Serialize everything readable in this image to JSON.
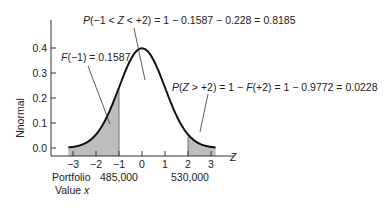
{
  "chart_data": {
    "type": "area",
    "title": "",
    "xlabel": "Z",
    "ylabel": "Nnormal",
    "x_ticks": [
      -3,
      -2,
      -1,
      0,
      1,
      2,
      3
    ],
    "x_tick_labels": [
      "−3",
      "−2",
      "−1",
      "0",
      "1",
      "2",
      "3"
    ],
    "y_ticks": [
      0.0,
      0.1,
      0.2,
      0.3,
      0.4
    ],
    "y_tick_labels": [
      "0.0",
      "0.1",
      "0.2",
      "0.3",
      "0.4"
    ],
    "xlim": [
      -3.3,
      3.3
    ],
    "ylim": [
      0,
      0.45
    ],
    "series": [
      {
        "name": "Standard normal density",
        "x": [
          -3,
          -2.5,
          -2,
          -1.5,
          -1,
          -0.5,
          0,
          0.5,
          1,
          1.5,
          2,
          2.5,
          3
        ],
        "values": [
          0.0044,
          0.0175,
          0.054,
          0.1295,
          0.242,
          0.3521,
          0.3989,
          0.3521,
          0.242,
          0.1295,
          0.054,
          0.0175,
          0.0044
        ]
      }
    ],
    "shaded_regions": [
      {
        "from": "-inf",
        "to": -1,
        "label": "F(−1) = 0.1587"
      },
      {
        "from": 2,
        "to": "+inf",
        "label": "P(Z > +2) = 1 − F(+2) = 1 − 0.9772 = 0.0228"
      }
    ],
    "annotations": [
      "P(−1 < Z < +2) = 1 − 0.1587 − 0.228 = 0.8185",
      "F(−1) = 0.1587",
      "P(Z > +2) = 1 − F(+2) = 1 − 0.9772 = 0.0228"
    ],
    "secondary_axis": {
      "label": "Portfolio Value x",
      "ticks": [
        {
          "z": -1,
          "label": "485,000"
        },
        {
          "z": 2,
          "label": "530,000"
        }
      ]
    },
    "grid": false,
    "legend": "none"
  },
  "labels": {
    "ylabel": "Nnormal",
    "xlabel": "Z",
    "y_ticks": [
      "0.0",
      "0.1",
      "0.2",
      "0.3",
      "0.4"
    ],
    "x_ticks": [
      "−3",
      "−2",
      "−1",
      "0",
      "1",
      "2",
      "3"
    ],
    "ann_middle_p": "P",
    "ann_middle_rest": "(−1 < ",
    "ann_middle_z": "Z",
    "ann_middle_tail": " < +2) = 1 − 0.1587 − 0.228 = 0.8185",
    "ann_left_f": "F",
    "ann_left_rest": "(−1) = 0.1587",
    "ann_right_p": "P",
    "ann_right_a": "(",
    "ann_right_z": "Z",
    "ann_right_b": " > +2) = 1 − ",
    "ann_right_f": "F",
    "ann_right_c": "(+2) = 1 − 0.9772 = 0.0228",
    "portfolio_line1": "Portfolio",
    "portfolio_line2": "Value ",
    "portfolio_x": "x",
    "val_485": "485,000",
    "val_530": "530,000"
  }
}
